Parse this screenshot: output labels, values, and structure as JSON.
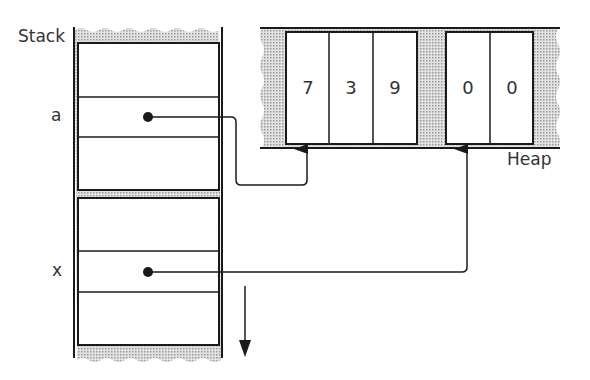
{
  "diagram": {
    "stack": {
      "label": "Stack",
      "frames": [
        {
          "slots": [
            "",
            "a",
            ""
          ]
        },
        {
          "slots": [
            "",
            "x",
            ""
          ]
        }
      ],
      "growth_direction": "down"
    },
    "heap": {
      "label": "Heap",
      "blocks": [
        {
          "values": [
            "7",
            "3",
            "9"
          ]
        },
        {
          "values": [
            "0",
            "0"
          ]
        }
      ]
    },
    "pointers": [
      {
        "from": "a",
        "to": "heap.blocks.0"
      },
      {
        "from": "x",
        "to": "heap.blocks.1"
      }
    ],
    "colors": {
      "line": "#1a1a1a",
      "stipple": "#bdbdbd",
      "background": "#ffffff"
    }
  }
}
